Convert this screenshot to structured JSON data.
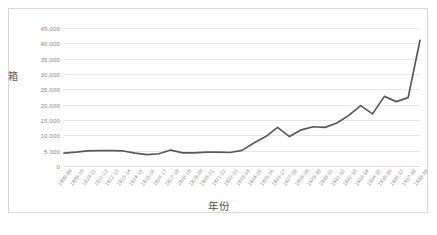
{
  "chart_data": {
    "type": "line",
    "title": "",
    "xlabel": "年份",
    "ylabel": "箱",
    "ylim": [
      0,
      45000
    ],
    "ytick_labels": [
      "45,000",
      "40,000",
      "35,000",
      "30,000",
      "25,000",
      "20,000",
      "15,000",
      "10,000",
      "5,000",
      "0"
    ],
    "ytick_values": [
      45000,
      40000,
      35000,
      30000,
      25000,
      20000,
      15000,
      10000,
      5000,
      0
    ],
    "grid": true,
    "legend": false,
    "legend_position": "none",
    "line_color": "#595959",
    "categories": [
      "1808-09",
      "1809-10",
      "1810-11",
      "1811-12",
      "1812-13",
      "1813-14",
      "1814-15",
      "1815-16",
      "1816-17",
      "1817-18",
      "1818-19",
      "1819-20",
      "1820-21",
      "1821-22",
      "1822-23",
      "1823-24",
      "1824-25",
      "1825-26",
      "1826-27",
      "1827-28",
      "1828-29",
      "1829-30",
      "1830-31",
      "1831-32",
      "1832-33",
      "1833-34",
      "1834-35",
      "1835-36",
      "1836-37",
      "1837-38",
      "1838-39"
    ],
    "values": [
      4200,
      4500,
      4900,
      5000,
      5000,
      4900,
      4200,
      3700,
      4000,
      5200,
      4300,
      4300,
      4500,
      4500,
      4400,
      5100,
      7500,
      9600,
      12600,
      9600,
      11800,
      12800,
      12600,
      14000,
      16500,
      19700,
      17000,
      22700,
      21000,
      22300,
      41000
    ],
    "value_pixels_note": "values estimated from gridline positions at 5,000-unit intervals"
  }
}
